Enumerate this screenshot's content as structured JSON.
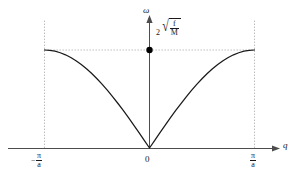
{
  "chart_data": {
    "type": "line",
    "title": "",
    "subtitle": "",
    "xlabel": "q",
    "ylabel": "ω",
    "xlim": [
      -1,
      1
    ],
    "ylim": [
      0,
      1.18
    ],
    "grid": false,
    "legend_position": "none",
    "x_tick_labels": [
      "−π/a",
      "0",
      "π/a"
    ],
    "x_tick_values": [
      -1,
      0,
      1
    ],
    "y_tick_labels": [
      "2√(f/M)"
    ],
    "y_tick_values": [
      1
    ],
    "annotations": [
      {
        "name": "max-frequency-label",
        "text": "2√(f/M)",
        "coefficient": "2",
        "numerator": "f",
        "denominator": "M",
        "at_x": 0,
        "at_y": 1
      }
    ],
    "markers": [
      {
        "name": "zone-center-max-point",
        "x": 0,
        "y": 1
      }
    ],
    "series": [
      {
        "name": "acoustic-branch",
        "formula": "omega = 2*sqrt(f/M)*|sin(q*a/2)|",
        "x": [
          -1.0,
          -0.95,
          -0.9,
          -0.85,
          -0.8,
          -0.75,
          -0.7,
          -0.65,
          -0.6,
          -0.55,
          -0.5,
          -0.45,
          -0.4,
          -0.35,
          -0.3,
          -0.25,
          -0.2,
          -0.15,
          -0.1,
          -0.05,
          0.0,
          0.05,
          0.1,
          0.15,
          0.2,
          0.25,
          0.3,
          0.35,
          0.4,
          0.45,
          0.5,
          0.55,
          0.6,
          0.65,
          0.7,
          0.75,
          0.8,
          0.85,
          0.9,
          0.95,
          1.0
        ],
        "y": [
          1.0,
          0.997,
          0.988,
          0.972,
          0.951,
          0.924,
          0.891,
          0.853,
          0.809,
          0.76,
          0.707,
          0.649,
          0.588,
          0.522,
          0.454,
          0.383,
          0.309,
          0.233,
          0.156,
          0.078,
          0.0,
          0.078,
          0.156,
          0.233,
          0.309,
          0.383,
          0.454,
          0.522,
          0.588,
          0.649,
          0.707,
          0.76,
          0.809,
          0.853,
          0.891,
          0.924,
          0.951,
          0.972,
          0.988,
          0.997,
          1.0
        ]
      }
    ],
    "guide_lines": [
      {
        "name": "left-zone-boundary",
        "orientation": "vertical",
        "value": -1,
        "style": "dashed"
      },
      {
        "name": "right-zone-boundary",
        "orientation": "vertical",
        "value": 1,
        "style": "dashed"
      },
      {
        "name": "max-frequency-level",
        "orientation": "horizontal",
        "value": 1,
        "style": "dashed"
      }
    ],
    "colors": {
      "curve": "#1a1a1a",
      "axis": "#4d4d4d",
      "guide": "#b3b3b3",
      "marker": "#000000",
      "background": "#ffffff",
      "text": "#1a1a1a"
    }
  },
  "axes": {
    "y_axis_label": "ω",
    "x_axis_label": "q",
    "origin_label": "0"
  },
  "ticks": {
    "left": {
      "minus": "−",
      "numerator": "π",
      "denominator": "a"
    },
    "right": {
      "numerator": "π",
      "denominator": "a"
    }
  },
  "peak": {
    "coefficient": "2",
    "radical": "√",
    "numerator": "f",
    "denominator": "M"
  }
}
